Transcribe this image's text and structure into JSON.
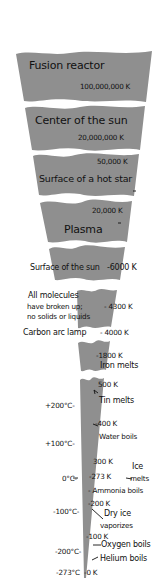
{
  "diagram": {
    "colors": {
      "band": "#8f8f8f",
      "background": "#ffffff",
      "text": "#111111"
    },
    "bands": [
      {
        "label": "Fusion reactor",
        "value": "100,000,000 K"
      },
      {
        "label": "Center of the sun",
        "value": "20,000,000 K"
      },
      {
        "label": "Surface of a hot star",
        "value": "50,000 K"
      },
      {
        "label": "Plasma",
        "value": "20,000 K"
      },
      {
        "label": "Surface of the sun",
        "value": "6000 K"
      },
      {
        "label": "All molecules have broken up; no solids or liquids",
        "value": "4300 K"
      },
      {
        "label": "Carbon arc lamp",
        "value": "4000 K"
      },
      {
        "label": "Iron melts",
        "value": "1800 K"
      },
      {
        "label": "Tin melts",
        "value": "500 K"
      },
      {
        "label": "Water boils",
        "value": "400 K"
      },
      {
        "label": "Ice melts",
        "value": "273 K"
      },
      {
        "label": "Ammonia boils",
        "value": ""
      },
      {
        "label": "Dry ice vaporizes",
        "value": "200 K"
      },
      {
        "label": "Oxygen boils",
        "value": "100 K"
      },
      {
        "label": "Helium boils",
        "value": "0 K"
      }
    ],
    "labels": {
      "fusion_reactor": "Fusion reactor",
      "fusion_value": "100,000,000 K",
      "center_sun": "Center of the sun",
      "center_sun_value": "20,000,000 K",
      "hot_star_value": "50,000 K",
      "hot_star": "Surface of a hot star",
      "plasma_value": "20,000 K",
      "plasma": "Plasma",
      "surface_sun": "Surface of the sun",
      "surface_sun_value": "-6000 K",
      "molecules_line1": "All molecules",
      "molecules_line2": "have broken up;",
      "molecules_line3": "no solids or liquids",
      "molecules_value": "- 4300 K",
      "carbon_arc": "Carbon arc lamp",
      "carbon_arc_value": "- 4000 K",
      "iron_value": "-1800 K",
      "iron_melts": "Iron melts",
      "tin_value": "500 K",
      "tin_melts": "Tin melts",
      "k400": "-400 K",
      "water_boils": "Water boils",
      "k300": "300 K",
      "k273": "-273 K",
      "ice": "Ice",
      "melts": "melts",
      "ammonia_boils": "- Ammonia boils",
      "k200": "-200 K",
      "dry_ice": "Dry ice",
      "vaporizes": "vaporizes",
      "k100": "-100 K",
      "oxygen_boils": "Oxygen boils",
      "helium_boils": "Helium boils",
      "k0": "-0 K"
    },
    "celsius": {
      "c200": "+200°C-",
      "c100": "+100°C-",
      "c0": "0°C-",
      "cm100": "-100°C-",
      "cm200": "-200°C-",
      "cm273": "-273°C"
    }
  }
}
